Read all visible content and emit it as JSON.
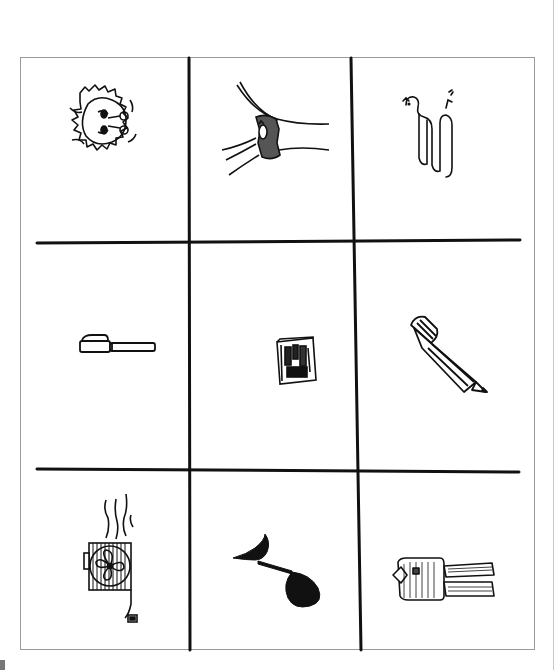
{
  "worksheet": {
    "layout": "3x3 picture grid",
    "rows": 3,
    "columns": 3,
    "line_color": "#111111",
    "frame_color": "#9a9a9a",
    "cells": [
      {
        "row": 1,
        "col": 1,
        "picture": "lion",
        "icon": "lion-head-icon"
      },
      {
        "row": 1,
        "col": 2,
        "picture": "nest",
        "icon": "nest-on-branch-icon"
      },
      {
        "row": 1,
        "col": 3,
        "picture": "snake",
        "icon": "snake-icon"
      },
      {
        "row": 2,
        "col": 1,
        "picture": "pen",
        "icon": "pen-icon"
      },
      {
        "row": 2,
        "col": 2,
        "picture": "book",
        "icon": "book-icon"
      },
      {
        "row": 2,
        "col": 3,
        "picture": "pencil",
        "icon": "pencil-icon"
      },
      {
        "row": 3,
        "col": 1,
        "picture": "fan",
        "icon": "fan-icon"
      },
      {
        "row": 3,
        "col": 2,
        "picture": "note",
        "icon": "music-note-icon"
      },
      {
        "row": 3,
        "col": 3,
        "picture": "suit",
        "icon": "suit-icon"
      }
    ]
  }
}
